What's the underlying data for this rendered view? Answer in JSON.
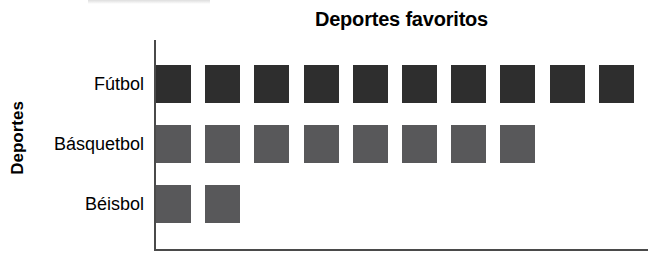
{
  "chart_data": {
    "type": "bar",
    "subtype": "pictograph",
    "title": "Deportes favoritos",
    "xlabel": "",
    "ylabel": "Deportes",
    "categories": [
      "Fútbol",
      "Básquetbol",
      "Béisbol"
    ],
    "values": [
      10,
      8,
      2
    ],
    "unit": "cuadrado",
    "grid": false,
    "legend": null,
    "orientation": "horizontal",
    "xlim": [
      0,
      10
    ],
    "series": [
      {
        "name": "Deportes favoritos",
        "values": [
          10,
          8,
          2
        ]
      }
    ],
    "rows": [
      {
        "label": "Fútbol",
        "count": 10,
        "color": "#2e2e2e"
      },
      {
        "label": "Básquetbol",
        "count": 8,
        "color": "#58585a"
      },
      {
        "label": "Béisbol",
        "count": 2,
        "color": "#58585a"
      }
    ],
    "colors": {
      "row1": "#2e2e2e",
      "row2": "#58585a",
      "row3": "#58585a",
      "axis": "#4a4a4a",
      "text": "#000000",
      "background": "#ffffff"
    }
  }
}
